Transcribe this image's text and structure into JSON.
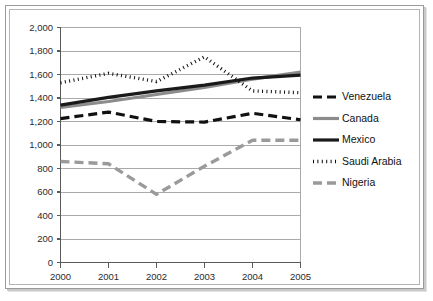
{
  "chart_data": {
    "type": "line",
    "title": "",
    "xlabel": "",
    "ylabel": "",
    "categories": [
      "2000",
      "2001",
      "2002",
      "2003",
      "2004",
      "2005"
    ],
    "x": [
      2000,
      2001,
      2002,
      2003,
      2004,
      2005
    ],
    "ylim": [
      0,
      2000
    ],
    "ytick_step": 200,
    "ytick_labels": [
      "0",
      "200",
      "400",
      "600",
      "800",
      "1,000",
      "1,200",
      "1,400",
      "1,600",
      "1,800",
      "2,000"
    ],
    "ytick_values": [
      0,
      200,
      400,
      600,
      800,
      1000,
      1200,
      1400,
      1600,
      1800,
      2000
    ],
    "grid": true,
    "grid_axis": "y",
    "legend_position": "right",
    "series": [
      {
        "name": "Venezuela",
        "values": [
          1225,
          1280,
          1200,
          1195,
          1270,
          1215
        ],
        "color": "#111111",
        "style": "dashed",
        "width": 3.2,
        "dash": "9,5"
      },
      {
        "name": "Canada",
        "values": [
          1320,
          1370,
          1430,
          1490,
          1560,
          1620
        ],
        "color": "#8c8c8c",
        "style": "solid",
        "width": 3.2,
        "dash": "none"
      },
      {
        "name": "Mexico",
        "values": [
          1340,
          1405,
          1460,
          1510,
          1570,
          1595
        ],
        "color": "#1a1a1a",
        "style": "solid",
        "width": 3.2,
        "dash": "none"
      },
      {
        "name": "Saudi Arabia",
        "values": [
          1530,
          1610,
          1540,
          1750,
          1460,
          1445
        ],
        "color": "#0d0d0d",
        "style": "dotted",
        "width": 3.4,
        "dash": "1,3.4"
      },
      {
        "name": "Nigeria",
        "values": [
          860,
          840,
          580,
          820,
          1040,
          1040
        ],
        "color": "#9a9a9a",
        "style": "dashed",
        "width": 3.4,
        "dash": "9,5"
      }
    ]
  },
  "legend": {
    "items": [
      {
        "label": "Venezuela"
      },
      {
        "label": "Canada"
      },
      {
        "label": "Mexico"
      },
      {
        "label": "Saudi Arabia"
      },
      {
        "label": "Nigeria"
      }
    ]
  },
  "colors": {
    "frame_border": "#9a9a9a",
    "grid": "#aaaaaa",
    "axis": "#5a5a5a",
    "background": "#ffffff",
    "text": "#2a2a2a"
  }
}
